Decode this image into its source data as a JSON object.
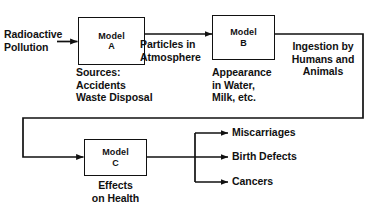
{
  "diagram": {
    "line_color": "#111111",
    "background_color": "#ffffff",
    "boxes": [
      {
        "id": "a",
        "line1": "Model",
        "line2": "A"
      },
      {
        "id": "b",
        "line1": "Model",
        "line2": "B"
      },
      {
        "id": "c",
        "line1": "Model",
        "line2": "C"
      }
    ],
    "labels": {
      "input": "Radioactive\nPollution",
      "sources": "Sources:\nAccidents\nWaste Disposal",
      "particles": "Particles in\nAtmosphere",
      "appearance": "Appearance\nin Water,\nMilk, etc.",
      "ingestion": "Ingestion by\nHumans and\nAnimals",
      "effects": "Effects\non Health"
    },
    "outcomes": [
      {
        "label": "Miscarriages"
      },
      {
        "label": "Birth Defects"
      },
      {
        "label": "Cancers"
      }
    ]
  }
}
